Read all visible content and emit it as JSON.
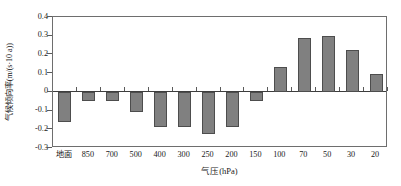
{
  "chart_data": {
    "type": "bar",
    "title": "",
    "xlabel": "气压(hPa)",
    "ylabel": "气候倾向率(m/(s·10 a))",
    "categories": [
      "地面",
      "850",
      "700",
      "500",
      "400",
      "300",
      "250",
      "200",
      "150",
      "100",
      "70",
      "50",
      "30",
      "20"
    ],
    "values": [
      -0.16,
      -0.05,
      -0.05,
      -0.11,
      -0.19,
      -0.19,
      -0.225,
      -0.19,
      -0.05,
      0.135,
      0.29,
      0.3,
      0.225,
      0.095
    ],
    "ylim": [
      -0.3,
      0.4
    ],
    "yticks": [
      "0.4",
      "0.3",
      "0.2",
      "0.1",
      "0",
      "-0.1",
      "-0.2",
      "-0.3"
    ],
    "ytick_values": [
      0.4,
      0.3,
      0.2,
      0.1,
      0,
      -0.1,
      -0.2,
      -0.3
    ],
    "grid": false,
    "legend": false,
    "bar_color": "#808080",
    "bar_border_color": "#4d4d4d",
    "axis_color": "#6e6e6e",
    "zero_line": 0
  }
}
